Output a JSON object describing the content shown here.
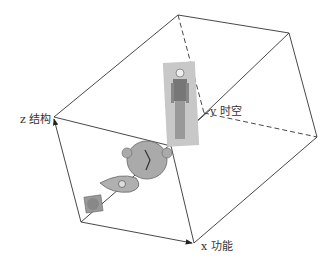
{
  "diagram": {
    "type": "3d-box-axes",
    "axes": {
      "x": {
        "label": "x 功能"
      },
      "y": {
        "label": "y 时空"
      },
      "z": {
        "label": "z 结构"
      }
    },
    "items": [
      {
        "name": "cell-image",
        "order": 1
      },
      {
        "name": "tissue-image",
        "order": 2
      },
      {
        "name": "organ-image",
        "order": 3
      },
      {
        "name": "human-body-image",
        "order": 4
      }
    ],
    "colors": {
      "line": "#333333",
      "image_tone": "#8a8a8a"
    }
  }
}
